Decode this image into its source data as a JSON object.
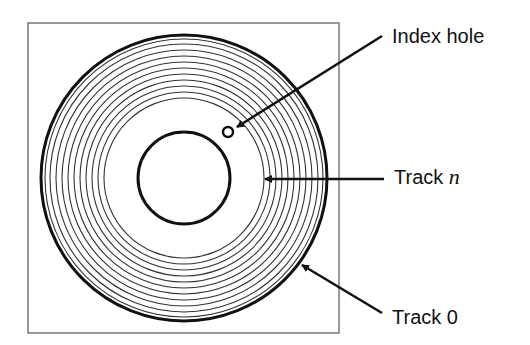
{
  "diagram": {
    "labels": {
      "index_hole": "Index hole",
      "track_n_prefix": "Track ",
      "track_n_var": "n",
      "track_0": "Track 0"
    },
    "geometry": {
      "frame": {
        "x": 28,
        "y": 23,
        "width": 311,
        "height": 310
      },
      "disk_center": {
        "x": 184,
        "y": 178
      },
      "outer_track_radius": 143,
      "hub_radius": 46,
      "index_hole": {
        "x": 228,
        "y": 132,
        "r": 5
      },
      "track_radii": [
        80,
        86,
        92,
        98,
        104,
        110,
        116,
        122,
        128,
        134,
        139
      ]
    },
    "colors": {
      "stroke": "#111111",
      "thin_stroke": "#333333",
      "frame": "#555555",
      "background": "#ffffff"
    }
  }
}
